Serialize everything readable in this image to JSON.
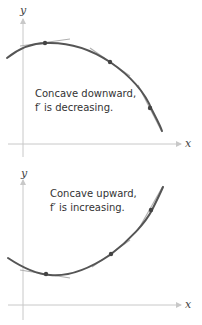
{
  "figures": [
    {
      "id": "concave-downward",
      "axes": {
        "x_label": "x",
        "y_label": "y"
      },
      "caption": {
        "line1": "Concave downward,",
        "line2": "f′ is decreasing."
      },
      "description": "Downward-opening curve with tangent lines whose slopes decrease left to right",
      "tangent_points": 3
    },
    {
      "id": "concave-upward",
      "axes": {
        "x_label": "x",
        "y_label": "y"
      },
      "caption": {
        "line1": "Concave upward,",
        "line2": "f′ is increasing."
      },
      "description": "Upward-opening curve with tangent lines whose slopes increase left to right",
      "tangent_points": 3
    }
  ],
  "colors": {
    "curve": "#555555",
    "axis": "#c8c8c8",
    "tangent": "#b0b0b0",
    "text": "#333333"
  }
}
